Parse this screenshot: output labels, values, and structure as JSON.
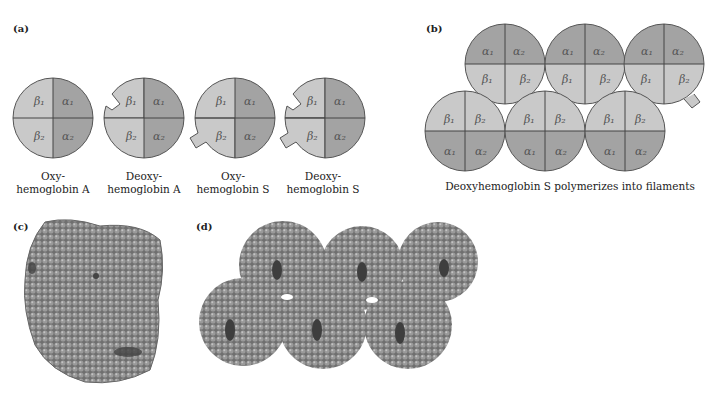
{
  "panels": {
    "a": {
      "label": "(a)",
      "items": [
        {
          "line1": "Oxy-",
          "line2": "hemoglobin A",
          "cx": 53,
          "notch": "none"
        },
        {
          "line1": "Deoxy-",
          "line2": "hemoglobin A",
          "cx": 144,
          "notch": "top"
        },
        {
          "line1": "Oxy-",
          "line2": "hemoglobin S",
          "cx": 235,
          "notch": "bottom"
        },
        {
          "line1": "Deoxy-",
          "line2": "hemoglobin S",
          "cx": 325,
          "notch": "both"
        }
      ],
      "subunits": {
        "b1": "β1",
        "b2": "β2",
        "a1": "α1",
        "a2": "α2"
      }
    },
    "b": {
      "label": "(b)",
      "caption": "Deoxyhemoglobin S polymerizes into filaments"
    },
    "c": {
      "label": "(c)"
    },
    "d": {
      "label": "(d)"
    }
  },
  "colors": {
    "beta": "#c9c9c9",
    "alpha": "#a3a3a3",
    "outline": "#555555",
    "molecule": "#8a8a8a",
    "molecule_dark": "#4a4a4a"
  }
}
